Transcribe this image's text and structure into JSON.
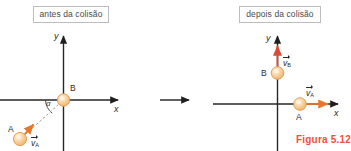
{
  "figure": {
    "caption": "Figura 5.12",
    "caption_color": "#f2503c"
  },
  "colors": {
    "axis": "#262626",
    "ball_fill": "#f6c88c",
    "ball_stroke": "#e8943b",
    "ball_highlight": "#fdf0dc",
    "vector_orange": "#e8762c",
    "vector_red": "#d94a3a",
    "dashed_line": "#9a9a9a",
    "label_box_border": "#bcbcbc",
    "text": "#2b2b2b"
  },
  "panels": [
    {
      "id": "before",
      "title": "antes da colisão",
      "axes": {
        "x_label": "x",
        "y_label": "y"
      },
      "angle_label": "α",
      "bodies": [
        {
          "id": "B",
          "label": "B",
          "at_origin": true
        },
        {
          "id": "A",
          "label": "A",
          "at_origin": false
        }
      ],
      "vectors": [
        {
          "id": "vA",
          "symbol": "v",
          "subscript": "A",
          "color": "#e8762c",
          "direction": "up-right"
        }
      ]
    },
    {
      "id": "after",
      "title": "depois da colisão",
      "axes": {
        "x_label": "x",
        "y_label": "y"
      },
      "bodies": [
        {
          "id": "B",
          "label": "B",
          "on_axis": "y"
        },
        {
          "id": "A",
          "label": "A",
          "on_axis": "x"
        }
      ],
      "vectors": [
        {
          "id": "vB",
          "symbol": "v",
          "subscript": "B",
          "color": "#d94a3a",
          "direction": "up"
        },
        {
          "id": "vA",
          "symbol": "v",
          "subscript": "A",
          "color": "#e8762c",
          "direction": "right"
        }
      ]
    }
  ],
  "transition": {
    "icon": "right-arrow-icon"
  }
}
